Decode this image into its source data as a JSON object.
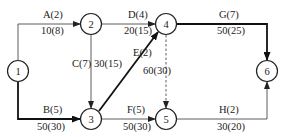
{
  "diagram": {
    "type": "activity-on-arrow network",
    "nodes": [
      {
        "id": "1",
        "label": "1",
        "x": 18,
        "y": 71
      },
      {
        "id": "2",
        "label": "2",
        "x": 91,
        "y": 24
      },
      {
        "id": "3",
        "label": "3",
        "x": 91,
        "y": 119
      },
      {
        "id": "4",
        "label": "4",
        "x": 166,
        "y": 24
      },
      {
        "id": "5",
        "label": "5",
        "x": 166,
        "y": 119
      },
      {
        "id": "6",
        "label": "6",
        "x": 267,
        "y": 71
      }
    ],
    "edges": [
      {
        "id": "A",
        "from": "1",
        "to": "2",
        "activity": "A(2)",
        "cost": "10(8)",
        "critical": false,
        "dummy": false
      },
      {
        "id": "B",
        "from": "1",
        "to": "3",
        "activity": "B(5)",
        "cost": "50(30)",
        "critical": true,
        "dummy": false
      },
      {
        "id": "C",
        "from": "2",
        "to": "3",
        "activity": "C(7)",
        "cost": "30(15)",
        "critical": false,
        "dummy": false
      },
      {
        "id": "D",
        "from": "2",
        "to": "4",
        "activity": "D(4)",
        "cost": "20(15)",
        "critical": false,
        "dummy": false
      },
      {
        "id": "E",
        "from": "3",
        "to": "4",
        "activity": "E(2)",
        "cost": "60(30)",
        "critical": true,
        "dummy": false
      },
      {
        "id": "F",
        "from": "3",
        "to": "5",
        "activity": "F(5)",
        "cost": "50(30)",
        "critical": false,
        "dummy": false
      },
      {
        "id": "dummy",
        "from": "4",
        "to": "5",
        "activity": "",
        "cost": "",
        "critical": false,
        "dummy": true
      },
      {
        "id": "G",
        "from": "4",
        "to": "6",
        "activity": "G(7)",
        "cost": "50(25)",
        "critical": true,
        "dummy": false
      },
      {
        "id": "H",
        "from": "5",
        "to": "6",
        "activity": "H(2)",
        "cost": "30(20)",
        "critical": false,
        "dummy": false
      }
    ],
    "colors": {
      "line": "#333333",
      "critical_line": "#111111",
      "background": "#ffffff"
    }
  }
}
